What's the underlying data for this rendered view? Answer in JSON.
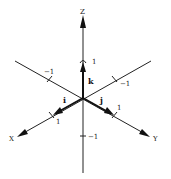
{
  "diagram": {
    "type": "3d-coordinate-axes",
    "axes": {
      "x": {
        "label": "X"
      },
      "y": {
        "label": "Y"
      },
      "z": {
        "label": "Z"
      }
    },
    "unit_vectors": {
      "i": {
        "label": "i"
      },
      "j": {
        "label": "j"
      },
      "k": {
        "label": "k"
      }
    },
    "ticks": {
      "x_pos": "1",
      "x_neg": "−1",
      "y_pos": "1",
      "y_neg": "−1",
      "z_pos": "1",
      "z_neg": "−1"
    }
  }
}
